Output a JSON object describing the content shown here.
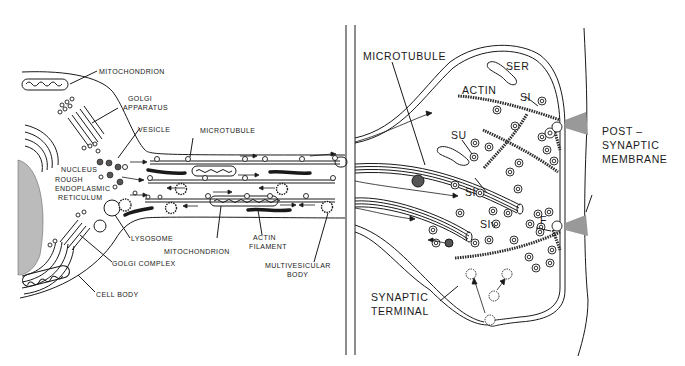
{
  "figure": {
    "panels": [
      {
        "id": "left",
        "description": "Neuron cell body and axon with organelles and axonal transport"
      },
      {
        "id": "right",
        "description": "Synaptic terminal contacting post-synaptic membrane"
      }
    ]
  },
  "left_panel": {
    "labels": {
      "mitochondrion_top": "MITOCHONDRION",
      "golgi_apparatus_1": "GOLGI",
      "golgi_apparatus_2": "APPARATUS",
      "vesicle": "VESICLE",
      "microtubule": "MICROTUBULE",
      "nucleus": "NUCLEUS",
      "rough_er_1": "ROUGH",
      "rough_er_2": "ENDOPLASMIC",
      "rough_er_3": "RETICULUM",
      "lysosome": "LYSOSOME",
      "mitochondrion_bottom": "MITOCHONDRION",
      "actin_1": "ACTIN",
      "actin_2": "FILAMENT",
      "golgi_complex": "GOLGI COMPLEX",
      "mvb_1": "MULTIVESICULAR",
      "mvb_2": "BODY",
      "cell_body": "CELL BODY"
    }
  },
  "right_panel": {
    "labels": {
      "microtubule": "MICROTUBULE",
      "ser": "SER",
      "actin": "ACTIN",
      "si_1": "SI",
      "su": "SU",
      "si_2": "SI",
      "si_3": "SI",
      "f": "F",
      "post_1": "POST –",
      "post_2": "SYNAPTIC",
      "post_3": "MEMBRANE",
      "terminal_1": "SYNAPTIC",
      "terminal_2": "TERMINAL"
    }
  }
}
